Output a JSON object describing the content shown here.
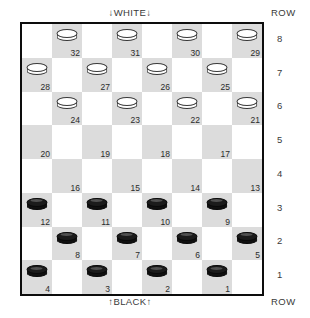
{
  "board": {
    "top_caption": "↓WHITE↓",
    "bottom_caption": "↑BLACK↑",
    "row_legend_top": "ROW",
    "row_legend_bottom": "ROW",
    "row_numbers": [
      "8",
      "7",
      "6",
      "5",
      "4",
      "3",
      "2",
      "1"
    ],
    "size": 8,
    "dark_square_color": "#dcdcdc",
    "light_square_color": "#ffffff",
    "border_color": "#0d0d0d",
    "white_piece_color": "#ffffff",
    "black_piece_color": "#101010",
    "squares": [
      {
        "number": "32",
        "row": 8,
        "col": 1,
        "piece": "white"
      },
      {
        "number": "31",
        "row": 8,
        "col": 3,
        "piece": "white"
      },
      {
        "number": "30",
        "row": 8,
        "col": 5,
        "piece": "white"
      },
      {
        "number": "29",
        "row": 8,
        "col": 7,
        "piece": "white"
      },
      {
        "number": "28",
        "row": 7,
        "col": 0,
        "piece": "white"
      },
      {
        "number": "27",
        "row": 7,
        "col": 2,
        "piece": "white"
      },
      {
        "number": "26",
        "row": 7,
        "col": 4,
        "piece": "white"
      },
      {
        "number": "25",
        "row": 7,
        "col": 6,
        "piece": "white"
      },
      {
        "number": "24",
        "row": 6,
        "col": 1,
        "piece": "white"
      },
      {
        "number": "23",
        "row": 6,
        "col": 3,
        "piece": "white"
      },
      {
        "number": "22",
        "row": 6,
        "col": 5,
        "piece": "white"
      },
      {
        "number": "21",
        "row": 6,
        "col": 7,
        "piece": "white"
      },
      {
        "number": "20",
        "row": 5,
        "col": 0,
        "piece": "none"
      },
      {
        "number": "19",
        "row": 5,
        "col": 2,
        "piece": "none"
      },
      {
        "number": "18",
        "row": 5,
        "col": 4,
        "piece": "none"
      },
      {
        "number": "17",
        "row": 5,
        "col": 6,
        "piece": "none"
      },
      {
        "number": "16",
        "row": 4,
        "col": 1,
        "piece": "none"
      },
      {
        "number": "15",
        "row": 4,
        "col": 3,
        "piece": "none"
      },
      {
        "number": "14",
        "row": 4,
        "col": 5,
        "piece": "none"
      },
      {
        "number": "13",
        "row": 4,
        "col": 7,
        "piece": "none"
      },
      {
        "number": "12",
        "row": 3,
        "col": 0,
        "piece": "black"
      },
      {
        "number": "11",
        "row": 3,
        "col": 2,
        "piece": "black"
      },
      {
        "number": "10",
        "row": 3,
        "col": 4,
        "piece": "black"
      },
      {
        "number": "9",
        "row": 3,
        "col": 6,
        "piece": "black"
      },
      {
        "number": "8",
        "row": 2,
        "col": 1,
        "piece": "black"
      },
      {
        "number": "7",
        "row": 2,
        "col": 3,
        "piece": "black"
      },
      {
        "number": "6",
        "row": 2,
        "col": 5,
        "piece": "black"
      },
      {
        "number": "5",
        "row": 2,
        "col": 7,
        "piece": "black"
      },
      {
        "number": "4",
        "row": 1,
        "col": 0,
        "piece": "black"
      },
      {
        "number": "3",
        "row": 1,
        "col": 2,
        "piece": "black"
      },
      {
        "number": "2",
        "row": 1,
        "col": 4,
        "piece": "black"
      },
      {
        "number": "1",
        "row": 1,
        "col": 6,
        "piece": "black"
      }
    ]
  }
}
